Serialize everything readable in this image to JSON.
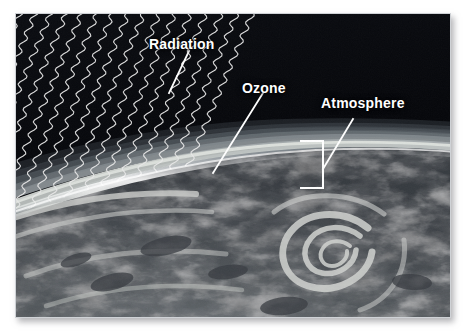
{
  "figure": {
    "kind": "annotated-photograph",
    "background_color": "#ffffff",
    "plate": {
      "border_color": "#cfd2d6",
      "shadow_color": "#787a7d",
      "space_color": "#05060a"
    }
  },
  "labels": {
    "radiation": {
      "text": "Radiation",
      "color": "#ffffff"
    },
    "ozone": {
      "text": "Ozone",
      "color": "#ffffff"
    },
    "atmosphere": {
      "text": "Atmosphere",
      "color": "#ffffff"
    }
  },
  "leaders": {
    "line_color": "#ffffff",
    "radiation_points": "188,50 168,92",
    "ozone_points": "262,92 212,172",
    "atmosphere_points": "352,118 322,168"
  },
  "atmosphere_bracket": {
    "color": "#ffffff",
    "top_y": 140,
    "bottom_y": 187,
    "stem_x": 322,
    "tick_length": 22
  },
  "radiation_rays": {
    "style": "wavy parallel lines",
    "color": "#e8e8e8",
    "count": 21,
    "direction": "upper-left to lower-right diagonal"
  },
  "atmosphere_bands": [
    {
      "name": "deep-space",
      "color": "#05060a"
    },
    {
      "name": "upper-haze",
      "color": "#3b4148"
    },
    {
      "name": "mid-haze",
      "color": "#626a71"
    },
    {
      "name": "ozone-glow",
      "color": "#d7dbd8"
    },
    {
      "name": "lower-haze",
      "color": "#7d858a"
    },
    {
      "name": "limb-rim",
      "color": "#f2f4f2"
    }
  ],
  "earth": {
    "ocean_color": "#4d5257",
    "cloud_color": "#e9ebe8",
    "terminator_color": "#2b2f33"
  }
}
